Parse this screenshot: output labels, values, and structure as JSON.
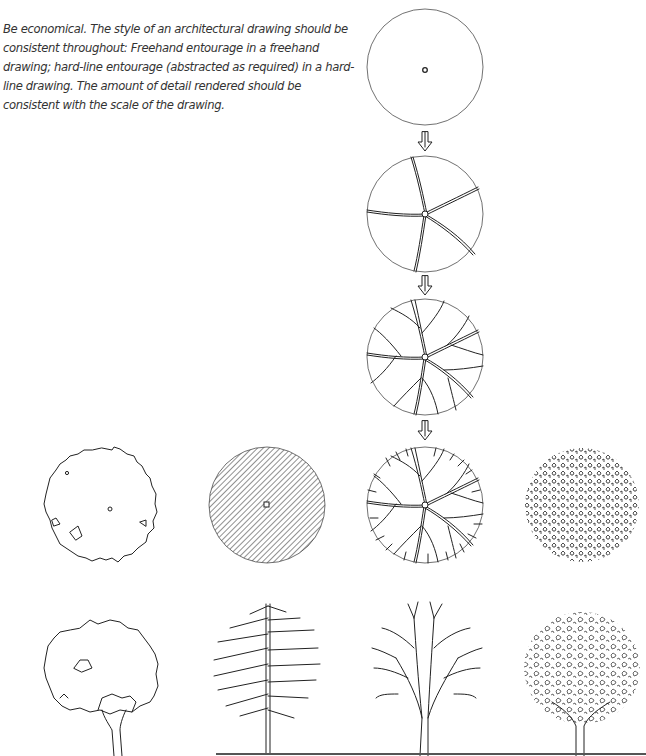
{
  "page": {
    "caption_lines": [
      "Be economical. The style of an architectural drawing should be",
      "consistent throughout: Freehand entourage in a freehand",
      "drawing; hard-line entourage (abstracted as required) in a hard-",
      "line drawing. The amount of detail rendered should be",
      "consistent with the scale of the drawing."
    ]
  },
  "figures": {
    "plan_sequence": [
      {
        "step": 1,
        "description": "Circle outline with center point",
        "icon": "tree-plan-outline-icon"
      },
      {
        "step": 2,
        "description": "Five main branches from center",
        "icon": "tree-plan-main-branches-icon"
      },
      {
        "step": 3,
        "description": "Secondary branches added",
        "icon": "tree-plan-secondary-branches-icon"
      },
      {
        "step": 4,
        "description": "Fine twig network to edge",
        "icon": "tree-plan-twigs-icon"
      }
    ],
    "arrows": [
      "arrow-down-icon",
      "arrow-down-icon",
      "arrow-down-icon"
    ],
    "plan_variants": [
      {
        "description": "Irregular foliage outline with center point",
        "icon": "tree-plan-foliage-outline-icon"
      },
      {
        "description": "Diagonal hatched circle",
        "icon": "tree-plan-hatched-icon"
      },
      {
        "description": "Branch structure (hard-line)",
        "icon": "tree-plan-branching-icon"
      },
      {
        "description": "Textured leaf clusters",
        "icon": "tree-plan-leaf-texture-icon"
      }
    ],
    "elevation_variants": [
      {
        "description": "Foliage outline elevation with trunk",
        "icon": "tree-elevation-outline-icon"
      },
      {
        "description": "Central trunk with herringbone branches",
        "icon": "tree-elevation-herringbone-icon"
      },
      {
        "description": "Branching structure elevation",
        "icon": "tree-elevation-branching-icon"
      },
      {
        "description": "Textured leaf canopy elevation",
        "icon": "tree-elevation-foliage-icon"
      }
    ]
  }
}
